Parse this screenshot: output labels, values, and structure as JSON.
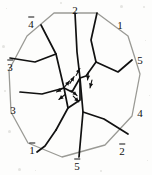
{
  "figure": {
    "type": "geometric-diagram",
    "background_color": "#fdfdfc",
    "boundary_color": "#9a9a95",
    "interior_color": "#111111",
    "label_color": "#111111",
    "boundary": {
      "name": "decagon",
      "sides": 10,
      "vertices": [
        {
          "x": 54,
          "y": 13
        },
        {
          "x": 97,
          "y": 13
        },
        {
          "x": 128,
          "y": 36
        },
        {
          "x": 140,
          "y": 74
        },
        {
          "x": 132,
          "y": 116
        },
        {
          "x": 105,
          "y": 145
        },
        {
          "x": 62,
          "y": 157
        },
        {
          "x": 28,
          "y": 143
        },
        {
          "x": 11,
          "y": 112
        },
        {
          "x": 9,
          "y": 70
        },
        {
          "x": 27,
          "y": 36
        }
      ]
    },
    "interior_edges": [
      {
        "name": "edge-a",
        "points": [
          [
            75,
            13
          ],
          [
            77,
            52
          ],
          [
            80,
            78
          ]
        ]
      },
      {
        "name": "edge-b",
        "points": [
          [
            80,
            78
          ],
          [
            83,
            112
          ],
          [
            79,
            157
          ]
        ]
      },
      {
        "name": "edge-c",
        "points": [
          [
            97,
            13
          ],
          [
            91,
            40
          ],
          [
            96,
            62
          ]
        ]
      },
      {
        "name": "edge-d",
        "points": [
          [
            96,
            62
          ],
          [
            118,
            72
          ],
          [
            132,
            60
          ]
        ]
      },
      {
        "name": "edge-e",
        "points": [
          [
            96,
            62
          ],
          [
            86,
            76
          ],
          [
            80,
            78
          ]
        ]
      },
      {
        "name": "edge-f",
        "points": [
          [
            83,
            112
          ],
          [
            104,
            119
          ],
          [
            128,
            134
          ]
        ]
      },
      {
        "name": "edge-g",
        "points": [
          [
            41,
            25
          ],
          [
            56,
            54
          ],
          [
            64,
            88
          ]
        ]
      },
      {
        "name": "edge-h",
        "points": [
          [
            64,
            88
          ],
          [
            68,
            108
          ],
          [
            56,
            130
          ]
        ]
      },
      {
        "name": "edge-i",
        "points": [
          [
            56,
            54
          ],
          [
            35,
            62
          ],
          [
            10,
            58
          ]
        ]
      },
      {
        "name": "edge-j",
        "points": [
          [
            64,
            88
          ],
          [
            42,
            94
          ],
          [
            20,
            92
          ]
        ]
      },
      {
        "name": "edge-k",
        "points": [
          [
            56,
            130
          ],
          [
            45,
            146
          ],
          [
            37,
            152
          ]
        ]
      },
      {
        "name": "edge-l",
        "points": [
          [
            64,
            88
          ],
          [
            72,
            92
          ],
          [
            80,
            78
          ]
        ]
      },
      {
        "name": "edge-m",
        "points": [
          [
            68,
            108
          ],
          [
            80,
            100
          ],
          [
            80,
            78
          ]
        ]
      }
    ],
    "arrow_marks": [
      {
        "name": "arrow-1",
        "x": 78,
        "y": 72,
        "angle": -62
      },
      {
        "name": "arrow-2",
        "x": 72,
        "y": 80,
        "angle": -58
      },
      {
        "name": "arrow-3",
        "x": 67,
        "y": 84,
        "angle": -50
      },
      {
        "name": "arrow-4",
        "x": 88,
        "y": 76,
        "angle": 96
      },
      {
        "name": "arrow-5",
        "x": 91,
        "y": 84,
        "angle": 104
      },
      {
        "name": "arrow-6",
        "x": 60,
        "y": 90,
        "angle": 150
      },
      {
        "name": "arrow-7",
        "x": 62,
        "y": 97,
        "angle": 142
      },
      {
        "name": "arrow-8",
        "x": 74,
        "y": 93,
        "angle": 40
      },
      {
        "name": "arrow-9",
        "x": 76,
        "y": 99,
        "angle": 46
      }
    ],
    "labels": [
      {
        "name": "label-2-top",
        "glyph": "2",
        "bar": false,
        "x": 75,
        "y": 10
      },
      {
        "name": "label-1-top-right",
        "glyph": "1",
        "bar": false,
        "x": 120,
        "y": 25
      },
      {
        "name": "label-5-right",
        "glyph": "5",
        "bar": false,
        "x": 140,
        "y": 60
      },
      {
        "name": "label-4-right",
        "glyph": "4",
        "bar": false,
        "x": 140,
        "y": 113
      },
      {
        "name": "label-2-bar-bottom-right",
        "glyph": "2",
        "bar": true,
        "x": 122,
        "y": 150
      },
      {
        "name": "label-5-bar-bottom",
        "glyph": "5",
        "bar": true,
        "x": 77,
        "y": 165
      },
      {
        "name": "label-1-bar-bottom-left",
        "glyph": "1",
        "bar": true,
        "x": 32,
        "y": 149
      },
      {
        "name": "label-3-left-lower",
        "glyph": "3",
        "bar": false,
        "x": 13,
        "y": 110
      },
      {
        "name": "label-3-bar-left-upper",
        "glyph": "3",
        "bar": true,
        "x": 10,
        "y": 66
      },
      {
        "name": "label-4-bar-top-left",
        "glyph": "4",
        "bar": true,
        "x": 31,
        "y": 23
      }
    ]
  }
}
